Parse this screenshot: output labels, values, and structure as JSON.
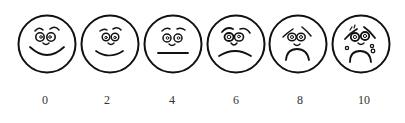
{
  "scale": {
    "type": "pain rating faces scale",
    "faces": [
      {
        "value": "0",
        "expression": "very happy"
      },
      {
        "value": "2",
        "expression": "happy"
      },
      {
        "value": "4",
        "expression": "neutral"
      },
      {
        "value": "6",
        "expression": "sad"
      },
      {
        "value": "8",
        "expression": "very sad"
      },
      {
        "value": "10",
        "expression": "crying"
      }
    ]
  }
}
